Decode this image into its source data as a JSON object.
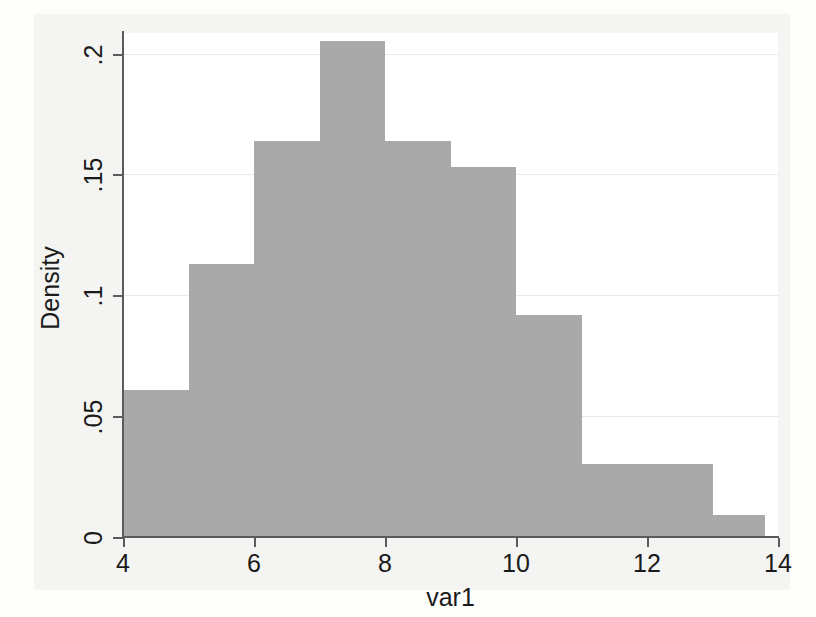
{
  "chart_data": {
    "type": "bar",
    "title": "",
    "subtitle": "",
    "xlabel": "var1",
    "ylabel": "Density",
    "xlim": [
      4,
      14
    ],
    "ylim": [
      0,
      0.2085
    ],
    "grid": true,
    "legend": null,
    "x_ticks": [
      "4",
      "6",
      "8",
      "10",
      "12",
      "14"
    ],
    "x_tick_values": [
      4,
      6,
      8,
      10,
      12,
      14
    ],
    "y_ticks": [
      "0",
      ".05",
      ".1",
      ".15",
      ".2"
    ],
    "y_tick_values": [
      0,
      0.05,
      0.1,
      0.15,
      0.2
    ],
    "bin_edges": [
      4.0,
      5.0,
      6.0,
      7.0,
      8.0,
      9.0,
      10.0,
      11.0,
      13.0,
      13.8
    ],
    "categories": [
      "4-5",
      "5-6",
      "6-7",
      "7-8",
      "8-9",
      "9-10",
      "10-11",
      "11-13",
      "13-13.8"
    ],
    "values": [
      0.061,
      0.113,
      0.164,
      0.205,
      0.164,
      0.153,
      0.092,
      0.03,
      0.009
    ],
    "bars": [
      {
        "label": "4-5",
        "start": 4.0,
        "end": 5.0,
        "value": 0.061
      },
      {
        "label": "5-6",
        "start": 5.0,
        "end": 6.0,
        "value": 0.113
      },
      {
        "label": "6-7",
        "start": 6.0,
        "end": 7.0,
        "value": 0.164
      },
      {
        "label": "7-8",
        "start": 7.0,
        "end": 8.0,
        "value": 0.205
      },
      {
        "label": "8-9",
        "start": 8.0,
        "end": 9.0,
        "value": 0.164
      },
      {
        "label": "9-10",
        "start": 9.0,
        "end": 10.0,
        "value": 0.153
      },
      {
        "label": "10-11",
        "start": 10.0,
        "end": 11.0,
        "value": 0.092
      },
      {
        "label": "11-13",
        "start": 11.0,
        "end": 13.0,
        "value": 0.03
      },
      {
        "label": "13-13.8",
        "start": 13.0,
        "end": 13.8,
        "value": 0.009
      }
    ],
    "colors": {
      "bar_fill": "#a9a9a9",
      "plot_background": "#ffffff",
      "graph_background": "#f4f4f2",
      "axis": "#5b5b5b",
      "gridline": "#e9e9ec",
      "text": "#1a1a1a"
    }
  }
}
